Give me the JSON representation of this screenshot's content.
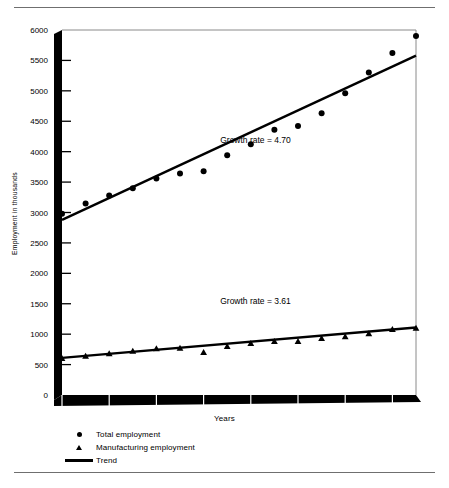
{
  "chart_data": {
    "type": "scatter",
    "title": "",
    "xlabel": "Years",
    "ylabel": "Employment in thousands",
    "xlim": [
      1965,
      1980
    ],
    "ylim": [
      0,
      6000
    ],
    "grid": false,
    "legend_position": "bottom-left",
    "y_ticks": [
      0,
      500,
      1000,
      1500,
      2000,
      2500,
      3000,
      3500,
      4000,
      4500,
      5000,
      5500,
      6000
    ],
    "x_ticks": [
      1965,
      1967,
      1969,
      1971,
      1973,
      1975,
      1977,
      1979
    ],
    "x_tick_labels": [
      "1965",
      "1967",
      "1969",
      "1971",
      "1973",
      "1975",
      "1977",
      "1979"
    ],
    "series": [
      {
        "name": "Total employment",
        "marker": "circle",
        "x": [
          1965,
          1966,
          1967,
          1968,
          1969,
          1970,
          1971,
          1972,
          1973,
          1974,
          1975,
          1976,
          1977,
          1978,
          1979,
          1980
        ],
        "values": [
          2980,
          3150,
          3280,
          3400,
          3560,
          3640,
          3680,
          3940,
          4120,
          4360,
          4420,
          4630,
          4960,
          5300,
          5620,
          5900
        ]
      },
      {
        "name": "Manufacturing employment",
        "marker": "triangle",
        "x": [
          1965,
          1966,
          1967,
          1968,
          1969,
          1970,
          1971,
          1972,
          1973,
          1974,
          1975,
          1976,
          1977,
          1978,
          1979,
          1980
        ],
        "values": [
          600,
          640,
          680,
          720,
          760,
          770,
          700,
          800,
          850,
          880,
          880,
          930,
          960,
          1010,
          1080,
          1100
        ]
      }
    ],
    "trend_lines": [
      {
        "name": "Total employment trend",
        "x": [
          1965,
          1980
        ],
        "values": [
          2880,
          5580
        ]
      },
      {
        "name": "Manufacturing employment trend",
        "x": [
          1965,
          1980
        ],
        "values": [
          610,
          1110
        ]
      }
    ],
    "annotations": [
      {
        "text": "Growth rate = 4.70",
        "x": 1973.2,
        "y": 4150
      },
      {
        "text": "Growth rate = 3.61",
        "x": 1973.2,
        "y": 1500
      }
    ],
    "legend": [
      {
        "label": "Total employment",
        "marker": "circle"
      },
      {
        "label": "Manufacturing employment",
        "marker": "triangle"
      },
      {
        "label": "Trend",
        "marker": "line"
      }
    ]
  },
  "colors": {
    "ink": "#000000",
    "frame": "#8a8a8a",
    "rule": "#6f6f6f",
    "background": "#ffffff"
  }
}
